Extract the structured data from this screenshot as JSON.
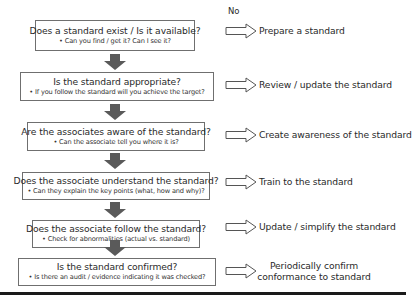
{
  "diagram": {
    "type": "flowchart",
    "no_label": "No",
    "steps": [
      {
        "question": "Does a standard exist / Is it available?",
        "detail": "• Can you find / get it? Can I see it?",
        "action": "Prepare a standard"
      },
      {
        "question": "Is the standard appropriate?",
        "detail": "• If you follow the standard will you achieve the target?",
        "action": "Review / update the standard"
      },
      {
        "question": "Are the associates aware of the standard?",
        "detail": "• Can the associate tell you where it is?",
        "action": "Create awareness of the standard"
      },
      {
        "question": "Does the associate understand the standard?",
        "detail": "• Can they explain the key points (what, how and why)?",
        "action": "Train to the standard"
      },
      {
        "question": "Does the associate follow the standard?",
        "detail": "• Check for abnormalities (actual vs. standard)",
        "action": "Update / simplify the standard"
      },
      {
        "question": "Is the standard confirmed?",
        "detail": "• Is there an audit / evidence indicating it was checked?",
        "action_line1": "Periodically confirm",
        "action_line2": "conformance to standard"
      }
    ],
    "colors": {
      "box_border": "#6f6f6f",
      "down_arrow": "#5a5a5a",
      "right_arrow_outline": "#555555",
      "text": "#2a2a2a",
      "bottom_bar": "#1a1a1a"
    }
  }
}
